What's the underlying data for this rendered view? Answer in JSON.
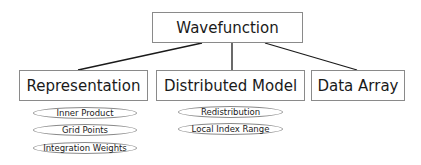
{
  "root": {
    "label": "Wavefunction"
  },
  "children": [
    {
      "label": "Representation",
      "attributes": [
        "Inner Product",
        "Grid Points",
        "Integration Weights"
      ]
    },
    {
      "label": "Distributed Model",
      "attributes": [
        "Redistribution",
        "Local Index Range"
      ]
    },
    {
      "label": "Data Array",
      "attributes": []
    }
  ],
  "colors": {
    "border": "#8a8a8a",
    "line": "#1a1a1a",
    "text": "#1a1a1a",
    "background": "#ffffff"
  }
}
